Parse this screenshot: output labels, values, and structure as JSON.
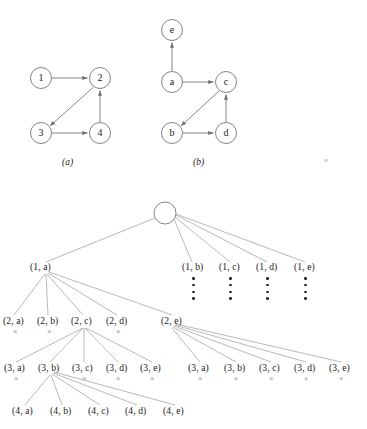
{
  "figure": {
    "stroke_color": "#6f6f6f",
    "text_color": "#1a1a1a",
    "x_mark_color": "#9a9a9a",
    "background": "#ffffff"
  },
  "graph_a": {
    "caption": "(a)",
    "nodes": [
      {
        "id": "1",
        "label": "1",
        "cx": 41,
        "cy": 78
      },
      {
        "id": "2",
        "label": "2",
        "cx": 100,
        "cy": 78
      },
      {
        "id": "3",
        "label": "3",
        "cx": 41,
        "cy": 133
      },
      {
        "id": "4",
        "label": "4",
        "cx": 100,
        "cy": 133
      }
    ],
    "edges": [
      {
        "from": "1",
        "to": "2"
      },
      {
        "from": "2",
        "to": "3"
      },
      {
        "from": "3",
        "to": "4"
      },
      {
        "from": "4",
        "to": "2"
      }
    ]
  },
  "graph_b": {
    "caption": "(b)",
    "nodes": [
      {
        "id": "e",
        "label": "e",
        "cx": 172,
        "cy": 30
      },
      {
        "id": "a",
        "label": "a",
        "cx": 172,
        "cy": 82
      },
      {
        "id": "c",
        "label": "c",
        "cx": 226,
        "cy": 82
      },
      {
        "id": "b",
        "label": "b",
        "cx": 172,
        "cy": 133
      },
      {
        "id": "d",
        "label": "d",
        "cx": 226,
        "cy": 133
      }
    ],
    "edges": [
      {
        "from": "a",
        "to": "e"
      },
      {
        "from": "a",
        "to": "c"
      },
      {
        "from": "c",
        "to": "b"
      },
      {
        "from": "b",
        "to": "d"
      },
      {
        "from": "d",
        "to": "c"
      }
    ]
  },
  "tree": {
    "root": {
      "label": "",
      "cx": 165,
      "cy": 213,
      "r": 11
    },
    "level1": [
      {
        "label": "(1, a)",
        "x": 30,
        "y": 268,
        "expanded": true,
        "dots": false
      },
      {
        "label": "(1, b)",
        "x": 182,
        "y": 268,
        "expanded": false,
        "dots": true
      },
      {
        "label": "(1, c)",
        "x": 219,
        "y": 268,
        "expanded": false,
        "dots": true
      },
      {
        "label": "(1, d)",
        "x": 256,
        "y": 268,
        "expanded": false,
        "dots": true
      },
      {
        "label": "(1, e)",
        "x": 294,
        "y": 268,
        "expanded": false,
        "dots": true
      }
    ],
    "level2": [
      {
        "label": "(2, a)",
        "x": 3,
        "y": 322,
        "marked": true,
        "expanded": false
      },
      {
        "label": "(2, b)",
        "x": 37,
        "y": 322,
        "marked": true,
        "expanded": false
      },
      {
        "label": "(2, c)",
        "x": 71,
        "y": 322,
        "marked": false,
        "expanded": true
      },
      {
        "label": "(2, d)",
        "x": 106,
        "y": 322,
        "marked": true,
        "expanded": false
      },
      {
        "label": "(2, e)",
        "x": 161,
        "y": 322,
        "marked": false,
        "expanded": true
      }
    ],
    "level3_left": [
      {
        "label": "(3, a)",
        "x": 4,
        "y": 369,
        "marked": true
      },
      {
        "label": "(3, b)",
        "x": 38,
        "y": 369,
        "marked": true,
        "expanded": true
      },
      {
        "label": "(3, c)",
        "x": 72,
        "y": 369,
        "marked": true
      },
      {
        "label": "(3, d)",
        "x": 106,
        "y": 369,
        "marked": true
      },
      {
        "label": "(3, e)",
        "x": 140,
        "y": 369,
        "marked": true
      }
    ],
    "level3_right": [
      {
        "label": "(3, a)",
        "x": 188,
        "y": 369,
        "marked": true
      },
      {
        "label": "(3, b)",
        "x": 224,
        "y": 369,
        "marked": true
      },
      {
        "label": "(3, c)",
        "x": 259,
        "y": 369,
        "marked": true
      },
      {
        "label": "(3, d)",
        "x": 294,
        "y": 369,
        "marked": true
      },
      {
        "label": "(3, e)",
        "x": 329,
        "y": 369,
        "marked": true
      }
    ],
    "level4": [
      {
        "label": "(4, a)",
        "x": 12,
        "y": 412
      },
      {
        "label": "(4, b)",
        "x": 50,
        "y": 412
      },
      {
        "label": "(4, c)",
        "x": 88,
        "y": 412
      },
      {
        "label": "(4, d)",
        "x": 125,
        "y": 412
      },
      {
        "label": "(4, e)",
        "x": 163,
        "y": 412
      }
    ],
    "x_mark_glyph": "×",
    "dots_count": 4
  }
}
